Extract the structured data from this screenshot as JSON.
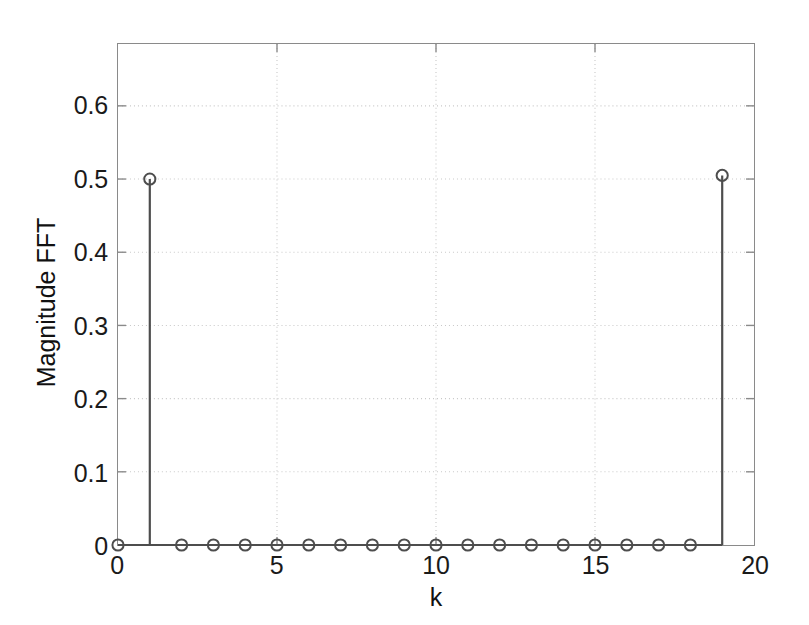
{
  "figure": {
    "background_color": "#ffffff",
    "axis_color": "#8a8a8a",
    "grid_color": "#c8c8c8",
    "data_color": "#4d4d4d",
    "text_color": "#111111"
  },
  "chart_data": {
    "type": "line",
    "plot_style": "stem",
    "title": "",
    "xlabel": "k",
    "ylabel": "Magnitude FFT",
    "x": [
      0,
      1,
      2,
      3,
      4,
      5,
      6,
      7,
      8,
      9,
      10,
      11,
      12,
      13,
      14,
      15,
      16,
      17,
      18,
      19
    ],
    "values": [
      0.0,
      0.5,
      0.0,
      0.0,
      0.0,
      0.0,
      0.0,
      0.0,
      0.0,
      0.0,
      0.0,
      0.0,
      0.0,
      0.0,
      0.0,
      0.0,
      0.0,
      0.0,
      0.0,
      0.505
    ],
    "series": [
      {
        "name": "Magnitude FFT",
        "values": [
          0.0,
          0.5,
          0.0,
          0.0,
          0.0,
          0.0,
          0.0,
          0.0,
          0.0,
          0.0,
          0.0,
          0.0,
          0.0,
          0.0,
          0.0,
          0.0,
          0.0,
          0.0,
          0.0,
          0.505
        ]
      }
    ],
    "xlim": [
      0,
      20
    ],
    "ylim": [
      0,
      0.6845
    ],
    "xticks": [
      0,
      5,
      10,
      15,
      20
    ],
    "xticklabels": [
      "0",
      "5",
      "10",
      "15",
      "20"
    ],
    "yticks": [
      0,
      0.1,
      0.2,
      0.3,
      0.4,
      0.5,
      0.6
    ],
    "yticklabels": [
      "0",
      "0.1",
      "0.2",
      "0.3",
      "0.4",
      "0.5",
      "0.6"
    ],
    "grid": true,
    "grid_style": "dotted",
    "legend": false,
    "legend_position": "none",
    "marker": "open-circle",
    "baseline": 0
  }
}
